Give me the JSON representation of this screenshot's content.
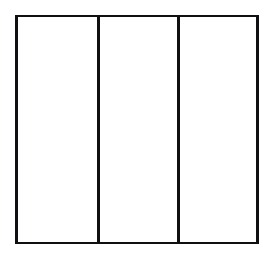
{
  "figure": {
    "title": "",
    "caption": "",
    "background_color": "#ffffff",
    "line_color": "#101012",
    "line_width_px": 2
  },
  "chart_data": {
    "type": "diagram",
    "title": "",
    "subtitle": "",
    "xlabel": "",
    "ylabel": "",
    "shape": "rectangle",
    "orientation": "horizontal",
    "panel_count": 3,
    "panels": [
      {
        "id": "panel-left",
        "label": "",
        "fill": "#ffffff",
        "width_fraction": 0.335
      },
      {
        "id": "panel-middle",
        "label": "",
        "fill": "#ffffff",
        "width_fraction": 0.328
      },
      {
        "id": "panel-right",
        "label": "",
        "fill": "#ffffff",
        "width_fraction": 0.337
      }
    ],
    "dividers": [
      {
        "id": "divider-1",
        "orientation": "vertical",
        "x_fraction": 0.336
      },
      {
        "id": "divider-2",
        "orientation": "vertical",
        "x_fraction": 0.664
      }
    ],
    "bounds": {
      "left": 15,
      "top": 15,
      "right": 259,
      "bottom": 244,
      "width": 244,
      "height": 229
    },
    "grid": false,
    "legend": [],
    "annotations": [],
    "tick_labels": {
      "x": [],
      "y": []
    }
  }
}
